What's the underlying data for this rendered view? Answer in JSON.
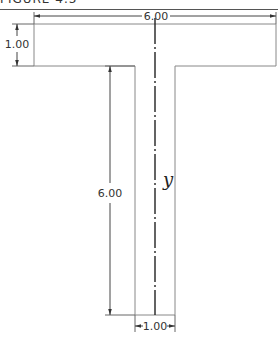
{
  "figure": {
    "caption": "FIGURE 4.3",
    "shape": "T-section",
    "centerline_label": "y"
  },
  "dimensions": {
    "flange_width": "6.00",
    "flange_thickness": "1.00",
    "web_height": "6.00",
    "web_width": "1.00"
  },
  "colors": {
    "outline": "#888888",
    "centerline": "#222222",
    "dimension": "#444444"
  }
}
